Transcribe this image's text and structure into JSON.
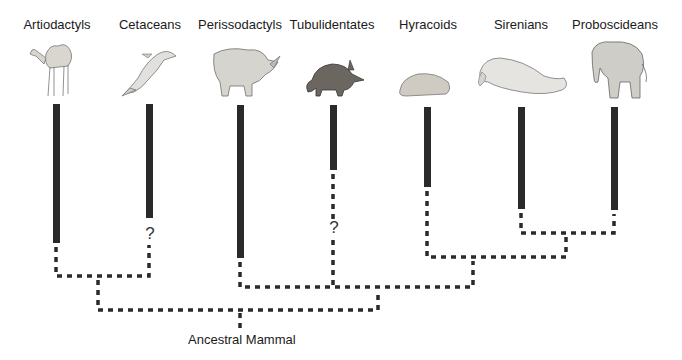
{
  "diagram": {
    "type": "phylogenetic-tree",
    "root": "Ancestral Mammal",
    "taxa": [
      {
        "name": "Artiodactyls",
        "animal": "camel",
        "x": 57,
        "bar_top": 104,
        "bar_bottom": 243,
        "uncertain": false
      },
      {
        "name": "Cetaceans",
        "animal": "dolphin",
        "x": 150,
        "bar_top": 104,
        "bar_bottom": 218,
        "uncertain": true
      },
      {
        "name": "Perissodactyls",
        "animal": "rhinoceros",
        "x": 240,
        "bar_top": 105,
        "bar_bottom": 258,
        "uncertain": false
      },
      {
        "name": "Tubulidentates",
        "animal": "aardvark",
        "x": 334,
        "bar_top": 105,
        "bar_bottom": 170,
        "uncertain": true
      },
      {
        "name": "Hyracoids",
        "animal": "hyrax",
        "x": 428,
        "bar_top": 107,
        "bar_bottom": 187,
        "uncertain": false
      },
      {
        "name": "Sirenians",
        "animal": "manatee",
        "x": 521,
        "bar_top": 107,
        "bar_bottom": 209,
        "uncertain": false
      },
      {
        "name": "Proboscideans",
        "animal": "elephant",
        "x": 614,
        "bar_top": 107,
        "bar_bottom": 210,
        "uncertain": false
      }
    ],
    "uncertain_marker": "?",
    "clades": [
      {
        "members": [
          "Artiodactyls",
          "Cetaceans"
        ]
      },
      {
        "members": [
          "Sirenians",
          "Proboscideans"
        ]
      },
      {
        "members": [
          "Hyracoids",
          "Sirenians",
          "Proboscideans"
        ]
      },
      {
        "members": [
          "Perissodactyls",
          "Tubulidentates",
          "Hyracoids",
          "Sirenians",
          "Proboscideans"
        ]
      }
    ],
    "colors": {
      "bar": "#2a2a2a",
      "dash": "#2a2a2a",
      "background": "#ffffff"
    }
  }
}
